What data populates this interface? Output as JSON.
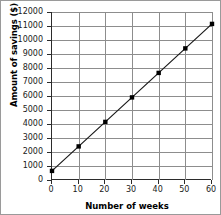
{
  "chart_data": {
    "type": "line",
    "title": "",
    "xlabel": "Number of weeks",
    "ylabel": "Amount of savings ($)",
    "xlim": [
      0,
      60
    ],
    "ylim": [
      0,
      12000
    ],
    "xticks": [
      0,
      10,
      20,
      30,
      40,
      50,
      60
    ],
    "yticks": [
      0,
      1000,
      2000,
      3000,
      4000,
      5000,
      6000,
      7000,
      8000,
      9000,
      10000,
      11000,
      12000
    ],
    "xtick_labels": [
      "0",
      "10",
      "20",
      "30",
      "40",
      "50",
      "60"
    ],
    "ytick_labels": [
      "0",
      "1000",
      "2000",
      "3000",
      "4000",
      "5000",
      "6000",
      "7000",
      "8000",
      "9000",
      "10000",
      "11000",
      "12000"
    ],
    "grid": "both",
    "legend": "none",
    "markers": "square",
    "line_color": "#1a1a1a",
    "marker_color": "#000000",
    "grid_color": "#8d8d8d",
    "axis_color": "#2b2b2b",
    "x": [
      0,
      10,
      20,
      30,
      40,
      50,
      60
    ],
    "values": [
      650,
      2400,
      4150,
      5900,
      7650,
      9400,
      11150
    ],
    "series": [
      {
        "name": "Amount of savings",
        "x": [
          0,
          10,
          20,
          30,
          40,
          50,
          60
        ],
        "values": [
          650,
          2400,
          4150,
          5900,
          7650,
          9400,
          11150
        ]
      }
    ]
  }
}
